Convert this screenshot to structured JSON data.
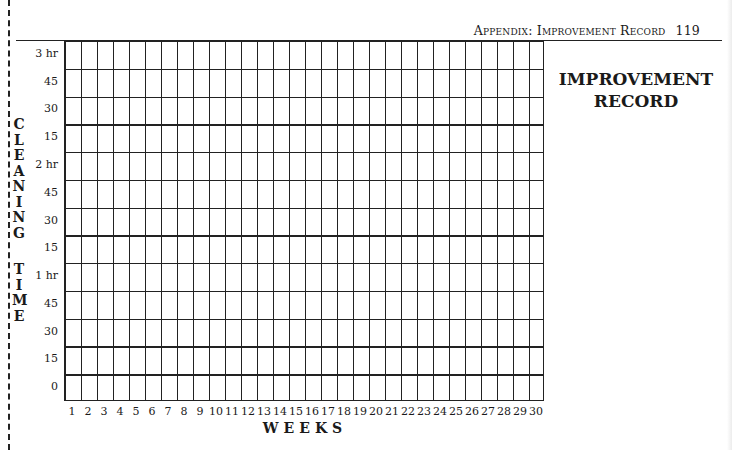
{
  "page": {
    "running_head": "Appendix: Improvement Record",
    "page_number": "119",
    "title_line1": "IMPROVEMENT",
    "title_line2": "RECORD"
  },
  "chart_data": {
    "type": "table",
    "title": "Improvement Record",
    "xlabel": "WEEKS",
    "ylabel": "CLEANING TIME",
    "y_axis_letters_1": [
      "C",
      "L",
      "E",
      "A",
      "N",
      "I",
      "N",
      "G"
    ],
    "y_axis_letters_2": [
      "T",
      "I",
      "M",
      "E"
    ],
    "y_ticks": [
      "3 hr",
      "45",
      "30",
      "15",
      "2 hr",
      "45",
      "30",
      "15",
      "1 hr",
      "45",
      "30",
      "15",
      "0"
    ],
    "x_ticks": [
      "1",
      "2",
      "3",
      "4",
      "5",
      "6",
      "7",
      "8",
      "9",
      "10",
      "11",
      "12",
      "13",
      "14",
      "15",
      "16",
      "17",
      "18",
      "19",
      "20",
      "21",
      "22",
      "23",
      "24",
      "25",
      "26",
      "27",
      "28",
      "29",
      "30"
    ],
    "rows": 13,
    "columns": 30,
    "grid": true,
    "values": []
  }
}
